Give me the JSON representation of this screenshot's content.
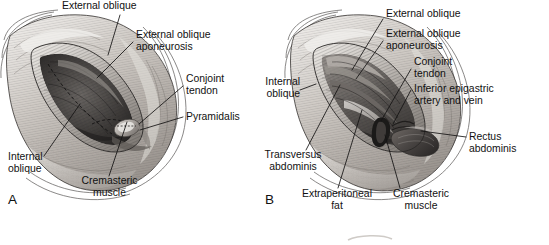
{
  "figure": {
    "type": "anatomical-illustration",
    "background_color": "#ffffff",
    "ink_color": "#111111",
    "panels": [
      {
        "id": "A",
        "letter": "A",
        "letter_x": 8,
        "letter_y": 193,
        "illustration": {
          "name": "inguinal-exposure-superficial",
          "bounds": {
            "x": 2,
            "y": 12,
            "w": 176,
            "h": 184
          }
        },
        "labels": [
          {
            "name": "external-oblique",
            "text": "External oblique",
            "align": "left",
            "x": 62,
            "y": 1,
            "leader": [
              [
                120,
                15
              ],
              [
                108,
                55
              ]
            ]
          },
          {
            "name": "external-oblique-aponeurosis",
            "text": "External oblique\naponeurosis",
            "align": "left",
            "x": 136,
            "y": 30,
            "leader": [
              [
                133,
                42
              ],
              [
                97,
                78
              ]
            ]
          },
          {
            "name": "conjoint-tendon",
            "text": "Conjoint\ntendon",
            "align": "left",
            "x": 186,
            "y": 74,
            "leader": [
              [
                183,
                86
              ],
              [
                139,
                124
              ]
            ]
          },
          {
            "name": "pyramidalis",
            "text": "Pyramidalis",
            "align": "left",
            "x": 186,
            "y": 112,
            "leader": [
              [
                183,
                117
              ],
              [
                140,
                130
              ]
            ]
          },
          {
            "name": "internal-oblique",
            "text": "Internal\noblique",
            "align": "left",
            "x": 8,
            "y": 152,
            "leader": [
              [
                44,
                156
              ],
              [
                80,
                104
              ]
            ]
          },
          {
            "name": "cremasteric-muscle",
            "text": "Cremasteric\nmuscle",
            "align": "center",
            "x": 57,
            "y": 176,
            "leader": [
              [
                109,
                176
              ],
              [
                127,
                122
              ]
            ]
          }
        ]
      },
      {
        "id": "B",
        "letter": "B",
        "letter_x": 265,
        "letter_y": 193,
        "illustration": {
          "name": "inguinal-exposure-deep",
          "bounds": {
            "x": 286,
            "y": 12,
            "w": 176,
            "h": 184
          }
        },
        "labels": [
          {
            "name": "external-oblique",
            "text": "External oblique",
            "align": "left",
            "x": 386,
            "y": 9,
            "leader": [
              [
                383,
                19
              ],
              [
                352,
                70
              ]
            ]
          },
          {
            "name": "external-oblique-aponeurosis",
            "text": "External oblique\naponeurosis",
            "align": "left",
            "x": 386,
            "y": 29,
            "leader": [
              [
                383,
                41
              ],
              [
                356,
                79
              ]
            ]
          },
          {
            "name": "conjoint-tendon",
            "text": "Conjoint\ntendon",
            "align": "left",
            "x": 414,
            "y": 57,
            "leader": [
              [
                411,
                69
              ],
              [
                381,
                121
              ]
            ]
          },
          {
            "name": "inferior-epigastric-artery-and-vein",
            "text": "Inferior epigastric\nartery and vein",
            "align": "left",
            "x": 414,
            "y": 84,
            "leader": [
              [
                411,
                90
              ],
              [
                393,
                124
              ]
            ]
          },
          {
            "name": "rectus-abdominis",
            "text": "Rectus\nabdominis",
            "align": "left",
            "x": 469,
            "y": 132,
            "leader": [
              [
                466,
                137
              ],
              [
                421,
                125
              ]
            ]
          },
          {
            "name": "internal-oblique",
            "text": "Internal\noblique",
            "align": "left",
            "x": 252,
            "y": 77,
            "leader": [
              [
                300,
                90
              ],
              [
                316,
                84
              ]
            ]
          },
          {
            "name": "transversus-abdominis",
            "text": "Transversus\nabdominis",
            "align": "center",
            "x": 243,
            "y": 150,
            "leader": [
              [
                306,
                150
              ],
              [
                340,
                85
              ]
            ]
          },
          {
            "name": "extraperitoneal-fat",
            "text": "Extraperitoneal\nfat",
            "align": "center",
            "x": 292,
            "y": 189,
            "leader": [
              [
                338,
                188
              ],
              [
                362,
                110
              ]
            ]
          },
          {
            "name": "cremasteric-muscle",
            "text": "Cremasteric\nmuscle",
            "align": "center",
            "x": 375,
            "y": 189,
            "leader": [
              [
                400,
                188
              ],
              [
                385,
                135
              ]
            ]
          }
        ]
      }
    ],
    "bottom_artifact": {
      "name": "next-figure-top-edge",
      "x": 345,
      "y": 236,
      "w": 48,
      "h": 5
    }
  }
}
